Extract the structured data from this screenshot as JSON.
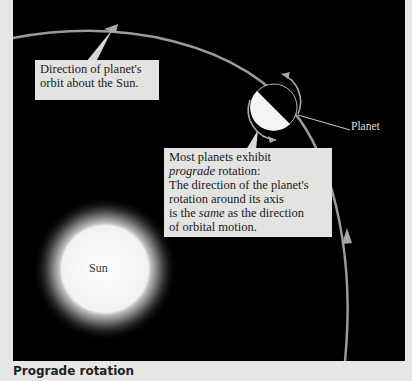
{
  "figure": {
    "caption": "Prograde rotation",
    "labels": {
      "orbit_direction": "Direction of planet's orbit about the Sun.",
      "prograde_line1": "Most planets exhibit",
      "prograde_italic": "prograde",
      "prograde_line2_rest": " rotation:",
      "prograde_line3": "The direction of the planet's",
      "prograde_line4": "rotation around its axis",
      "prograde_line5_pre": "is the ",
      "prograde_line5_italic": "same",
      "prograde_line5_post": " as the direction",
      "prograde_line6": "of orbital motion.",
      "sun": "Sun",
      "planet": "Planet"
    },
    "colors": {
      "background": "#000000",
      "orbit": "#9a9a9a",
      "label_box": "#e3e3e1",
      "page": "#e6e6e4"
    },
    "icons": [
      "orbit-arrow-icon",
      "rotation-arrow-icon"
    ]
  }
}
